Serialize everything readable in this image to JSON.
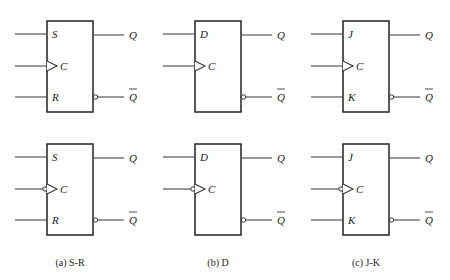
{
  "figure": {
    "panels": [
      {
        "id": "a",
        "caption": "(a) S-R",
        "x": 47,
        "inputs": [
          "S",
          "C",
          "R"
        ],
        "outputs": [
          "Q",
          "Q"
        ],
        "rows": [
          {
            "edge": "positive"
          },
          {
            "edge": "negative"
          }
        ]
      },
      {
        "id": "b",
        "caption": "(b) D",
        "x": 195,
        "inputs": [
          "D",
          "C"
        ],
        "outputs": [
          "Q",
          "Q"
        ],
        "rows": [
          {
            "edge": "positive"
          },
          {
            "edge": "negative"
          }
        ]
      },
      {
        "id": "c",
        "caption": "(c) J-K",
        "x": 343,
        "inputs": [
          "J",
          "C",
          "K"
        ],
        "outputs": [
          "Q",
          "Q"
        ],
        "rows": [
          {
            "edge": "positive"
          },
          {
            "edge": "negative"
          }
        ]
      }
    ],
    "row_tops": [
      21,
      144
    ],
    "box_width": 46,
    "box_height": 91
  }
}
